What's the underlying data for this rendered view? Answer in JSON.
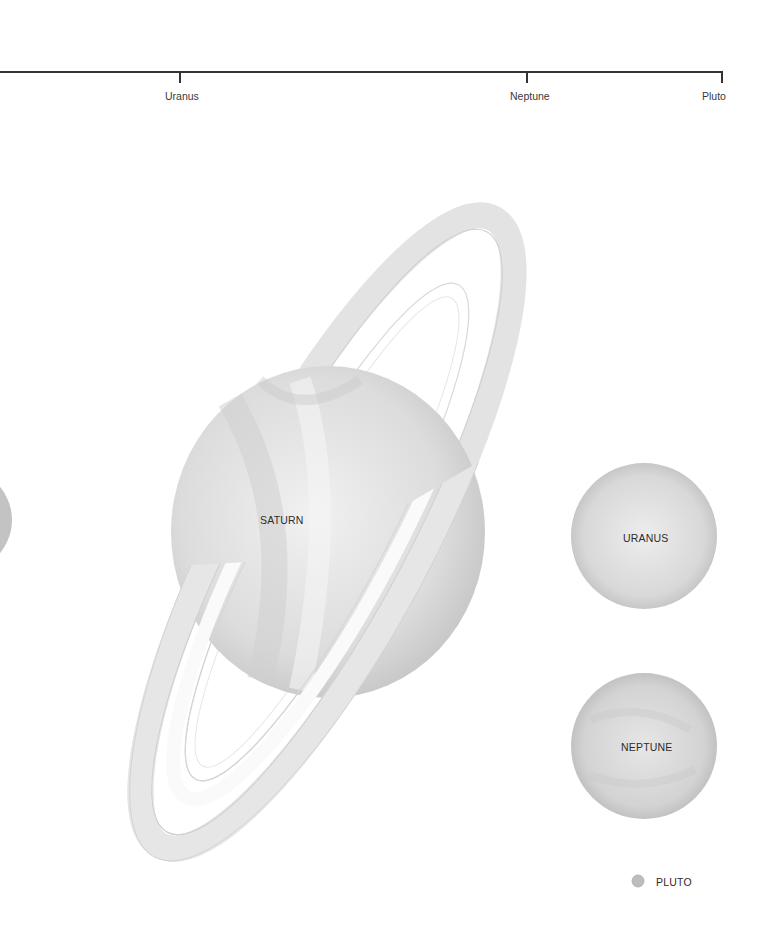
{
  "distance_scale": {
    "ticks": [
      {
        "label": "Uranus",
        "x": 180
      },
      {
        "label": "Neptune",
        "x": 527
      },
      {
        "label": "Pluto",
        "x": 722
      }
    ]
  },
  "planets": {
    "saturn": {
      "label": "SATURN"
    },
    "uranus": {
      "label": "URANUS"
    },
    "neptune": {
      "label": "NEPTUNE"
    },
    "pluto": {
      "label": "PLUTO"
    }
  },
  "colors": {
    "background": "#ffffff",
    "planet_fill": "#d9d9d9",
    "line": "#333333"
  }
}
